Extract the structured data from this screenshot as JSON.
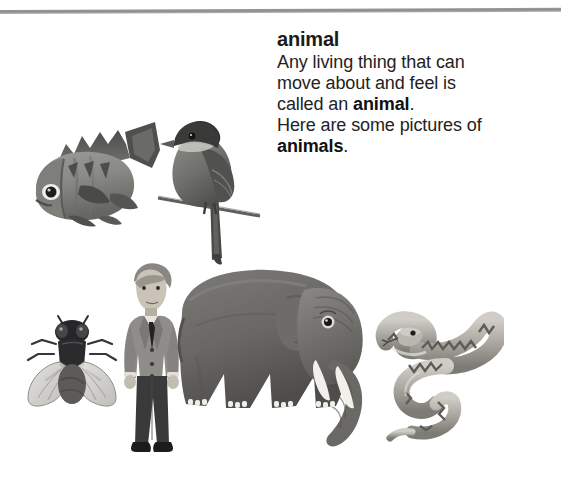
{
  "page": {
    "background_color": "#ffffff",
    "width": 561,
    "height": 482
  },
  "rule": {
    "color": "#8c8c8c",
    "name": "horizontal-rule"
  },
  "definition": {
    "headword": "animal",
    "lines": [
      {
        "text": "Any living thing that can",
        "bold_part": ""
      },
      {
        "text": "move about and feel is",
        "bold_part": ""
      },
      {
        "text": "called an ",
        "bold_part": "animal",
        "after": "."
      },
      {
        "text": "Here are some pictures of",
        "bold_part": ""
      },
      {
        "text": "",
        "bold_part": "animals",
        "after": "."
      }
    ],
    "line1": "Any living thing that can",
    "line2": "move about and feel is",
    "line3_pre": "called an ",
    "line3_bold": "animal",
    "line3_post": ".",
    "line4": "Here are some pictures of",
    "line5_bold": "animals",
    "line5_post": ".",
    "text_color": "#232323"
  },
  "illustrations": [
    {
      "id": "fish",
      "label": "fish",
      "alt": "grayscale illustration of a fish facing left with spiny dorsal fin"
    },
    {
      "id": "bird",
      "label": "bird",
      "alt": "grayscale illustration of a bird perched on a thin branch"
    },
    {
      "id": "fly",
      "label": "fly",
      "alt": "grayscale illustration of a fly with translucent wings"
    },
    {
      "id": "man",
      "label": "man",
      "alt": "illustration of a man in a gray suit jacket and dark trousers"
    },
    {
      "id": "elephant",
      "label": "elephant",
      "alt": "grayscale illustration of an elephant facing right with white tusks"
    },
    {
      "id": "snake",
      "label": "snake",
      "alt": "grayscale illustration of a coiled snake with zigzag pattern"
    }
  ],
  "palette": {
    "ink": "#232323",
    "headword": "#1b1b1b",
    "rule": "#8c8c8c",
    "gray_dark": "#4a4a4a",
    "gray_mid": "#7d7d7d",
    "gray_light": "#b5b5b5",
    "tusk_white": "#f2f0ea",
    "suit_gray": "#8f8d8a",
    "trouser_dark": "#3b3a3a"
  }
}
